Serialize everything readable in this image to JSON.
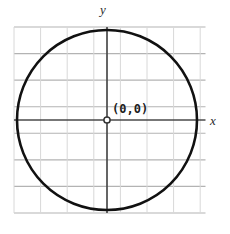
{
  "figure": {
    "background_color": "#ffffff",
    "width": 230,
    "height": 234
  },
  "labels": {
    "y_axis": "y",
    "x_axis": "x",
    "origin": "(0,0)"
  },
  "colors": {
    "grid": "#b3b3b3",
    "axis": "#4a4a4a",
    "curve": "#111111",
    "origin_marker_stroke": "#333333",
    "origin_marker_fill": "#ffffff",
    "text": "#2b2b2b"
  },
  "chart_data": {
    "type": "scatter",
    "title": "",
    "xlabel": "x",
    "ylabel": "y",
    "grid": true,
    "legend": null,
    "annotations": [
      {
        "text": "(0,0)",
        "x": 0,
        "y": 0,
        "marker": "open-circle"
      }
    ],
    "axes": {
      "x_axis_pixel_y": 120,
      "y_axis_pixel_x": 107,
      "plot_left": 14,
      "plot_right": 205.5,
      "plot_top": 27,
      "plot_bottom": 213,
      "grid_spacing_px": 26.6,
      "vertical_gridline_count": 7,
      "horizontal_gridline_count": 8,
      "vertical_gridlines_px": [
        14,
        40.6,
        67.2,
        93.8,
        120.4,
        147,
        173.6,
        200.2
      ],
      "horizontal_gridlines_px": [
        27,
        53.6,
        80.1,
        106.7,
        133.3,
        159.9,
        186.4,
        213
      ]
    },
    "series": [
      {
        "name": "circle",
        "shape": "circle",
        "center": [
          0,
          0
        ],
        "center_px": [
          107,
          120
        ],
        "radius_px": 90,
        "radius_units": 3.38,
        "stroke_width_px": 2.6,
        "closed": true
      }
    ]
  }
}
